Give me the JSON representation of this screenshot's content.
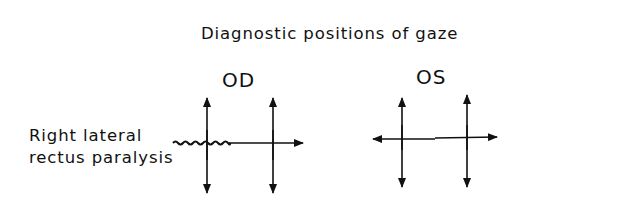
{
  "title": "Diagnostic positions of gaze",
  "eyes": [
    {
      "label": "OD",
      "meaning": "right eye"
    },
    {
      "label": "OS",
      "meaning": "left eye"
    }
  ],
  "condition": {
    "line1": "Right lateral",
    "line2": "rectus paralysis"
  },
  "diagrams": {
    "OD": {
      "vertical_arrows": 2,
      "horizontal_arrow": "rightward only",
      "restricted_segment": "left (wavy line, paralysis)"
    },
    "OS": {
      "vertical_arrows": 2,
      "horizontal_arrow": "bidirectional",
      "restricted_segment": "none"
    }
  },
  "colors": {
    "ink": "#111111",
    "background": "#ffffff"
  }
}
